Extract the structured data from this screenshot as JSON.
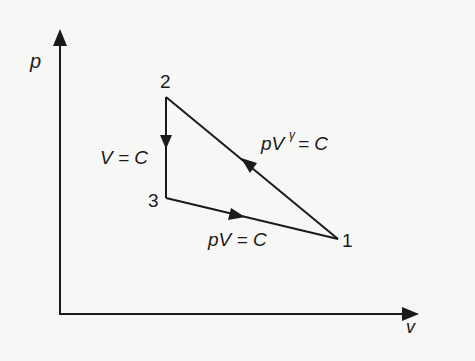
{
  "diagram": {
    "type": "p-V cycle diagram",
    "axes": {
      "y_label": "p",
      "x_label": "v"
    },
    "points": [
      {
        "id": "1",
        "label": "1"
      },
      {
        "id": "2",
        "label": "2"
      },
      {
        "id": "3",
        "label": "3"
      }
    ],
    "processes": [
      {
        "from": "1",
        "to": "2",
        "label_base": "pV",
        "label_sup": "γ",
        "label_rest": "= C"
      },
      {
        "from": "2",
        "to": "3",
        "label": "V = C"
      },
      {
        "from": "3",
        "to": "1",
        "label": "pV = C"
      }
    ],
    "colors": {
      "line": "#1a1a1a",
      "background": "#f7f7f5"
    }
  }
}
